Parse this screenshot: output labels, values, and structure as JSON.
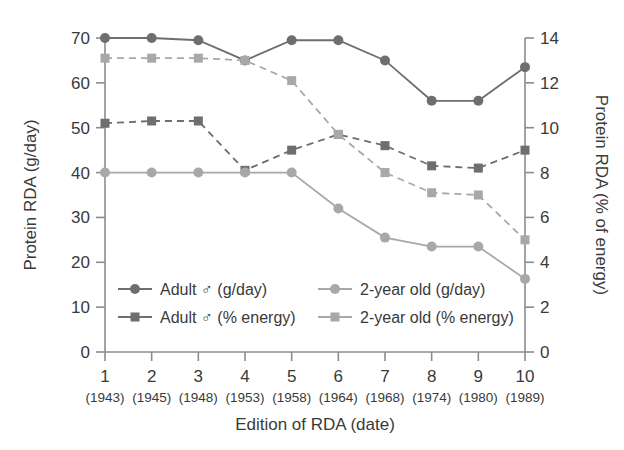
{
  "chart_data": {
    "type": "line",
    "title": "",
    "xlabel": "Edition of RDA (date)",
    "ylabel": "Protein RDA (g/day)",
    "y2label": "Protein RDA (% of energy)",
    "categories": [
      "1",
      "2",
      "3",
      "4",
      "5",
      "6",
      "7",
      "8",
      "9",
      "10"
    ],
    "category_sublabels": [
      "(1943)",
      "(1945)",
      "(1948)",
      "(1953)",
      "(1958)",
      "(1964)",
      "(1968)",
      "(1974)",
      "(1980)",
      "(1989)"
    ],
    "ylim": [
      0,
      70
    ],
    "yticks": [
      0,
      10,
      20,
      30,
      40,
      50,
      60,
      70
    ],
    "y2lim": [
      0,
      14
    ],
    "y2ticks": [
      0,
      2,
      4,
      6,
      8,
      10,
      12,
      14
    ],
    "grid": false,
    "legend_position": "inside-lower-left",
    "series": [
      {
        "name": "Adult ♂ (g/day)",
        "axis": "left",
        "marker": "circle",
        "linestyle": "solid",
        "color": "#6e6e6e",
        "values": [
          70.0,
          70.0,
          69.5,
          65.0,
          69.5,
          69.5,
          65.0,
          56.0,
          56.0,
          63.5
        ]
      },
      {
        "name": "Adult ♂ (% energy)",
        "axis": "right",
        "marker": "square",
        "linestyle": "dashed",
        "color": "#6e6e6e",
        "values": [
          10.2,
          10.3,
          10.3,
          8.1,
          9.0,
          9.7,
          9.2,
          8.3,
          8.2,
          9.0
        ]
      },
      {
        "name": "2-year old (g/day)",
        "axis": "left",
        "marker": "circle",
        "linestyle": "solid",
        "color": "#a8a8a8",
        "values": [
          40.0,
          40.0,
          40.0,
          40.0,
          40.0,
          32.0,
          25.5,
          23.5,
          23.5,
          16.3
        ]
      },
      {
        "name": "2-year old (% energy)",
        "axis": "right",
        "marker": "square",
        "linestyle": "dashed",
        "color": "#a8a8a8",
        "values": [
          13.1,
          13.1,
          13.1,
          13.0,
          12.1,
          9.7,
          8.0,
          7.1,
          7.0,
          5.0
        ]
      }
    ]
  },
  "colors": {
    "axis": "#8c8c8c",
    "text": "#3a3a3a",
    "series_dark": "#6e6e6e",
    "series_light": "#a8a8a8",
    "background": "#ffffff"
  }
}
